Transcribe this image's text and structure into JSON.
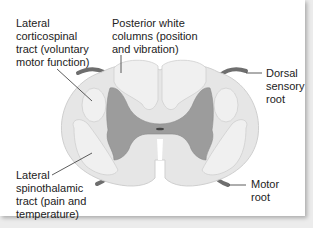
{
  "labels": {
    "lateral_corticospinal": "Lateral\ncorticospinal\ntract (voluntary\nmotor function)",
    "posterior_white_columns": "Posterior white\ncolumns (position\nand vibration)",
    "dorsal_sensory_root": "Dorsal\nsensory\nroot",
    "lateral_spinothalamic": "Lateral\nspinothalamic\ntract (pain and\ntemperature)",
    "motor_root": "Motor\nroot"
  },
  "colors": {
    "white_matter": "#e6e6e6",
    "white_matter_outline": "#cfcfcf",
    "tract_regions": "#f0f0f0",
    "gray_matter": "#9c9c9c",
    "nerve_roots": "#6e6e6e",
    "leader_lines": "#333333"
  }
}
